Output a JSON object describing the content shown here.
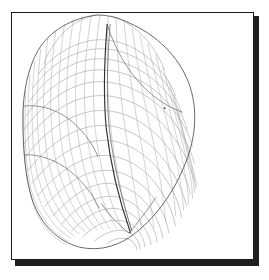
{
  "figure": {
    "title": "Structured curvilinear surface mesh",
    "caption": "",
    "background_color": "#ffffff",
    "frame": {
      "border_color": "#1c1c1c",
      "fill_color": "#ffffff",
      "shadow_color": "#0d0d0d",
      "x": 11,
      "y": 12,
      "width": 243,
      "height": 248
    }
  },
  "chart_data": {
    "type": "line",
    "title": "Structured curvilinear surface mesh",
    "subtitle": "",
    "xlabel": "",
    "ylabel": "",
    "xlim": [
      0,
      243
    ],
    "ylim": [
      0,
      248
    ],
    "grid": false,
    "legend": null,
    "tick_labels": {
      "x": [],
      "y": []
    },
    "annotations": [],
    "description": "Wireframe quadrilateral mesh of a teardrop / egg shaped three dimensional body, drawn as thin grey curvilinear gridlines with a darker silhouette edge and a dark seam line running from upper area down to the lower pole.",
    "colors": {
      "mesh_line": "#9a9a9a",
      "mesh_line_dense": "#a7a7a7",
      "silhouette": "#575757",
      "seam": "#303030",
      "crease": "#787878"
    },
    "geometry": {
      "shape": "teardrop-ellipsoid",
      "silhouette_points": [
        [
          20,
          46
        ],
        [
          24,
          30
        ],
        [
          34,
          16
        ],
        [
          52,
          6
        ],
        [
          74,
          2
        ],
        [
          98,
          4
        ],
        [
          124,
          14
        ],
        [
          150,
          34
        ],
        [
          170,
          60
        ],
        [
          182,
          90
        ],
        [
          186,
          118
        ],
        [
          184,
          146
        ],
        [
          172,
          174
        ],
        [
          152,
          200
        ],
        [
          126,
          220
        ],
        [
          98,
          232
        ],
        [
          72,
          234
        ],
        [
          48,
          228
        ],
        [
          30,
          212
        ],
        [
          20,
          190
        ],
        [
          14,
          160
        ],
        [
          10,
          124
        ],
        [
          12,
          86
        ],
        [
          20,
          46
        ]
      ],
      "seam_polyline": [
        [
          96,
          12
        ],
        [
          94,
          46
        ],
        [
          92,
          82
        ],
        [
          93,
          112
        ],
        [
          97,
          142
        ],
        [
          104,
          172
        ],
        [
          113,
          198
        ],
        [
          120,
          218
        ]
      ],
      "pole_lower": [
        118,
        222
      ],
      "pole_upper": [
        88,
        6
      ],
      "u_divisions": 34,
      "v_divisions": 26
    },
    "series": [
      {
        "name": "u-isolines (longitudinal)",
        "count": 34,
        "stroke": "#9a9a9a"
      },
      {
        "name": "v-isolines (latitudinal)",
        "count": 26,
        "stroke": "#a7a7a7"
      },
      {
        "name": "silhouette",
        "count": 1,
        "stroke": "#575757"
      },
      {
        "name": "seam",
        "count": 1,
        "stroke": "#303030"
      }
    ]
  }
}
